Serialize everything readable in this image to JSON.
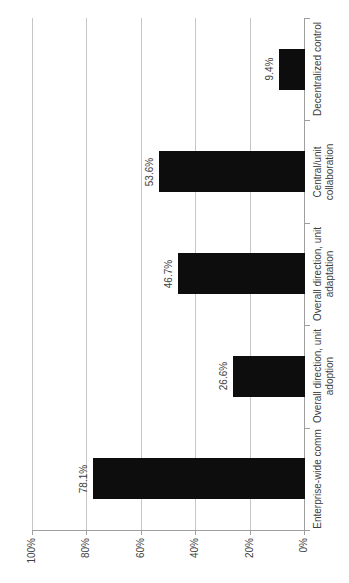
{
  "chart_data": {
    "type": "bar",
    "presentation": "column chart rotated 90 degrees counter-clockwise; all text reads bottom-to-top",
    "categories": [
      "Enterprise-wide comm",
      "Overall direction, unit adoption",
      "Overall direction, unit adaptation",
      "Central/unit collaboration",
      "Decentralized control"
    ],
    "category_label_lines": [
      [
        "Enterprise-wide comm"
      ],
      [
        "Overall direction, unit",
        "adoption"
      ],
      [
        "Overall direction, unit",
        "adaptation"
      ],
      [
        "Central/unit",
        "collaboration"
      ],
      [
        "Decentralized control"
      ]
    ],
    "values": [
      78.1,
      26.6,
      46.7,
      53.6,
      9.4
    ],
    "data_labels": [
      "78.1%",
      "26.6%",
      "46.7%",
      "53.6%",
      "9.4%"
    ],
    "value_axis": {
      "min": 0,
      "max": 100,
      "tick_step": 20,
      "tick_labels": [
        "0%",
        "20%",
        "40%",
        "60%",
        "80%",
        "100%"
      ],
      "grid": true
    },
    "legend": "none",
    "colors": {
      "bar": "#0d0d0d",
      "gridline": "#c6c6c6",
      "axis": "#9f9f9f",
      "text": "#404040",
      "background": "#ffffff"
    }
  }
}
